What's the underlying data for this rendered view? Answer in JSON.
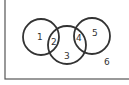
{
  "diagram": {
    "type": "venn",
    "universe": {
      "x": 5,
      "y": -2,
      "width": 125,
      "height": 81
    },
    "circles": [
      {
        "name": "left",
        "cx": 41,
        "cy": 37,
        "r": 18
      },
      {
        "name": "middle",
        "cx": 67,
        "cy": 45,
        "r": 19
      },
      {
        "name": "right",
        "cx": 92,
        "cy": 36,
        "r": 18
      }
    ],
    "regions": [
      {
        "label": "1",
        "x": 37,
        "y": 40
      },
      {
        "label": "2",
        "x": 51,
        "y": 45
      },
      {
        "label": "3",
        "x": 64,
        "y": 59
      },
      {
        "label": "4",
        "x": 76,
        "y": 41
      },
      {
        "label": "5",
        "x": 92,
        "y": 36
      },
      {
        "label": "6",
        "x": 104,
        "y": 65
      }
    ],
    "colors": {
      "stroke": "#333333",
      "background": "#ffffff"
    }
  }
}
